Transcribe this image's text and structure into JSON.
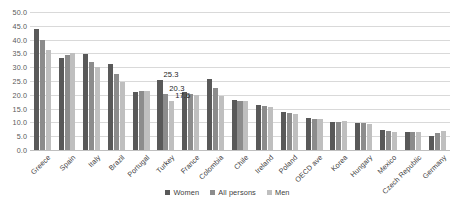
{
  "chart_data": {
    "type": "bar",
    "title": "",
    "subtitle": "",
    "xlabel": "",
    "ylabel": "",
    "ylim": [
      0,
      50
    ],
    "ytick_step": 5,
    "ytick_labels": [
      "50.0",
      "45.0",
      "40.0",
      "35.0",
      "30.0",
      "25.0",
      "20.0",
      "15.0",
      "10.0",
      "5.0",
      "0.0"
    ],
    "grid": true,
    "legend_position": "bottom-center",
    "categories": [
      "Greece",
      "Spain",
      "Italy",
      "Brazil",
      "Portugal",
      "Turkey",
      "France",
      "Colombia",
      "Chile",
      "Ireland",
      "Poland",
      "OECD ave",
      "Korea",
      "Hungary",
      "Mexico",
      "Czech Republic",
      "Germany"
    ],
    "series": [
      {
        "name": "Women",
        "color": "#595959",
        "values": [
          43.8,
          33.3,
          34.9,
          31.3,
          21.2,
          25.3,
          21.0,
          25.8,
          18.0,
          16.3,
          13.6,
          11.6,
          10.0,
          9.8,
          7.3,
          6.7,
          5.0
        ]
      },
      {
        "name": "All persons",
        "color": "#8c8c8c",
        "values": [
          40.0,
          34.3,
          31.9,
          27.5,
          21.3,
          20.3,
          20.4,
          22.3,
          17.8,
          15.9,
          13.3,
          11.4,
          10.2,
          9.7,
          6.9,
          6.6,
          6.2
        ]
      },
      {
        "name": "Men",
        "color": "#bfbfbf",
        "values": [
          36.3,
          35.0,
          30.0,
          24.8,
          21.4,
          17.6,
          19.9,
          19.5,
          17.6,
          15.6,
          13.0,
          11.2,
          10.4,
          9.6,
          6.5,
          6.5,
          6.8
        ]
      }
    ],
    "data_labels": [
      {
        "text": "25.3",
        "category": "Turkey",
        "series": "Women",
        "value": 25.3
      },
      {
        "text": "20.3",
        "category": "Turkey",
        "series": "All persons",
        "value": 20.3
      },
      {
        "text": "17.6",
        "category": "Turkey",
        "series": "Men",
        "value": 17.6
      }
    ]
  },
  "legend": {
    "items": [
      {
        "label": "Women"
      },
      {
        "label": "All persons"
      },
      {
        "label": "Men"
      }
    ]
  }
}
